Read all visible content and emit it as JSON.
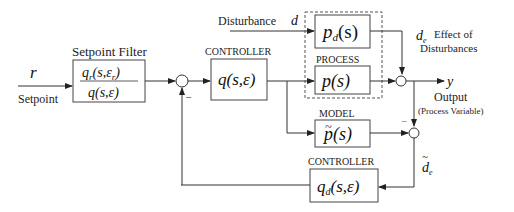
{
  "inputs": {
    "setpoint_symbol": "r",
    "setpoint_label": "Setpoint",
    "disturbance_label": "Disturbance",
    "disturbance_symbol": "d"
  },
  "blocks": {
    "setpoint_filter": {
      "title": "Setpoint Filter",
      "numerator": "q",
      "numerator_sub": "r",
      "numerator_args": "(s,ε",
      "numerator_args_sub": "r",
      "numerator_close": ")",
      "denominator": "q(s,ε)"
    },
    "controller": {
      "title": "CONTROLLER",
      "expr": "q(s,ε)"
    },
    "disturbance_process": {
      "expr_base": "p",
      "expr_sub": "d",
      "expr_args": "(s)"
    },
    "process": {
      "title": "PROCESS",
      "expr": "p(s)"
    },
    "model": {
      "title": "MODEL",
      "expr_tilde": "~",
      "expr": "p(s)"
    },
    "disturbance_controller": {
      "title": "CONTROLLER",
      "expr_base": "q",
      "expr_sub": "d",
      "expr_args": "(s,ε)"
    }
  },
  "signals": {
    "effect_symbol": "d",
    "effect_sub": "e",
    "effect_label_line1": "Effect of",
    "effect_label_line2": "Disturbances",
    "output_symbol": "y",
    "output_label": "Output",
    "output_sublabel": "(Process Variable)",
    "estimated_effect_tilde": "~",
    "estimated_effect_symbol": "d",
    "estimated_effect_sub": "e",
    "minus_sign": "–"
  }
}
